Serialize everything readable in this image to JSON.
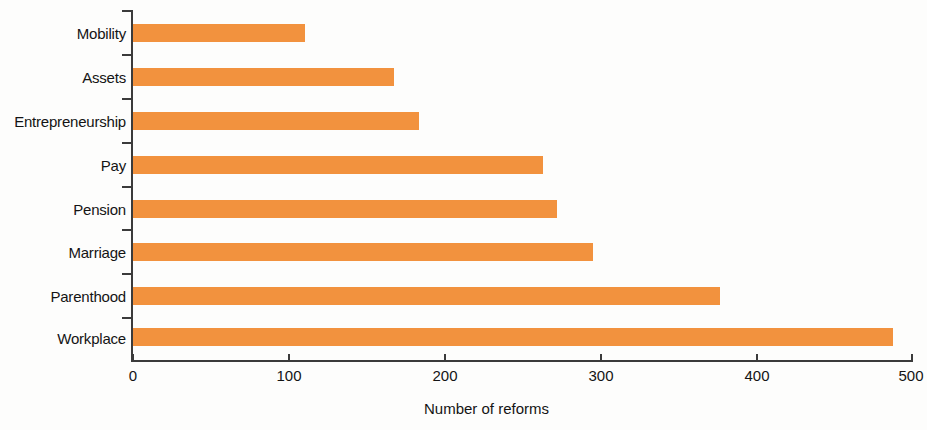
{
  "chart_data": {
    "type": "bar",
    "orientation": "horizontal",
    "title": "",
    "subtitle": "",
    "xlabel": "Number of reforms",
    "ylabel": "",
    "categories": [
      "Mobility",
      "Assets",
      "Entrepreneurship",
      "Pay",
      "Pension",
      "Marriage",
      "Parenthood",
      "Workplace"
    ],
    "values": [
      110,
      167,
      183,
      263,
      272,
      295,
      376,
      487
    ],
    "series": [
      {
        "name": "Number of reforms",
        "values": [
          110,
          167,
          183,
          263,
          272,
          295,
          376,
          487
        ],
        "color": "#f2923e"
      }
    ],
    "xlim": [
      0,
      500
    ],
    "xticks": [
      0,
      100,
      200,
      300,
      400,
      500
    ],
    "xtick_labels": [
      "0",
      "100",
      "200",
      "300",
      "400",
      "500"
    ],
    "grid": false,
    "legend": false,
    "legend_position": "none",
    "bar_color": "#f2923e",
    "axis_color": "#3b3b3b",
    "text_color": "#141414",
    "background": "#fdfdfc"
  }
}
